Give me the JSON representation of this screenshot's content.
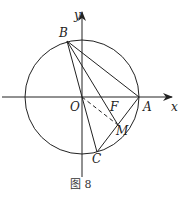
{
  "figure": {
    "caption": "图 8",
    "axes": {
      "x_label": "x",
      "y_label": "y"
    },
    "points": {
      "O": {
        "label": "O",
        "x": 82,
        "y": 97
      },
      "A": {
        "label": "A",
        "x": 139,
        "y": 97
      },
      "B": {
        "label": "B",
        "x": 67,
        "y": 41
      },
      "C": {
        "label": "C",
        "x": 97,
        "y": 152
      },
      "F": {
        "label": "F",
        "x": 110,
        "y": 97
      },
      "M": {
        "label": "M",
        "x": 118,
        "y": 125
      }
    },
    "circle": {
      "cx": 82,
      "cy": 97,
      "r": 57
    },
    "segments_solid": [
      "BA",
      "BO",
      "BM",
      "AC",
      "OC"
    ],
    "segments_dashed": [
      "OM"
    ],
    "colors": {
      "stroke": "#222222",
      "background": "#ffffff"
    }
  }
}
